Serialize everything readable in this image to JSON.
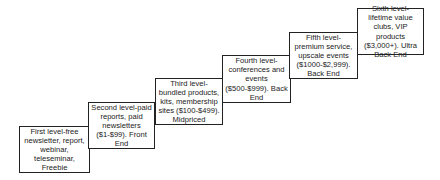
{
  "diagram": {
    "type": "staircase",
    "steps": [
      {
        "label": "First level-free newsletter, report, webinar, teleseminar, Freebie"
      },
      {
        "label": "Second level-paid reports, paid newsletters ($1-$99). Front End"
      },
      {
        "label": "Third level-bundled products, kits, membership sites ($100-$499). Midpriced"
      },
      {
        "label": "Fourth level-conferences and events ($500-$999). Back End"
      },
      {
        "label": "Fifth level-premium service, upscale events ($1000-$2,999). Back End"
      },
      {
        "label": "Sixth level-lifetime value clubs, VIP products ($3,000+). Ultra Back End"
      }
    ]
  }
}
